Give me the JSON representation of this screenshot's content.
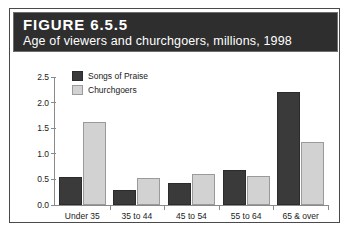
{
  "figure": {
    "title": "FIGURE 6.5.5",
    "subtitle": "Age of viewers and churchgoers, millions, 1998"
  },
  "colors": {
    "series_dark": "#3a3a3a",
    "series_light": "#d2d2d2",
    "header_background": "#2e2e2e",
    "frame_border": "#4a4a4a",
    "axis": "#8a8a8a"
  },
  "chart_data": {
    "type": "bar",
    "title": "Age of viewers and churchgoers, millions, 1998",
    "xlabel": "",
    "ylabel": "",
    "ylim": [
      0.0,
      2.5
    ],
    "yticks": [
      "0.0",
      "0.5",
      "1.0",
      "1.5",
      "2.0",
      "2.5"
    ],
    "ytick_values": [
      0.0,
      0.5,
      1.0,
      1.5,
      2.0,
      2.5
    ],
    "grid": false,
    "legend_position": "top-left inside",
    "categories": [
      "Under 35",
      "35 to 44",
      "45 to 54",
      "55 to 64",
      "65 & over"
    ],
    "series": [
      {
        "name": "Songs of Praise",
        "color": "#3a3a3a",
        "values": [
          0.55,
          0.3,
          0.43,
          0.68,
          2.2
        ]
      },
      {
        "name": "Churchgoers",
        "color": "#d2d2d2",
        "values": [
          1.62,
          0.53,
          0.6,
          0.57,
          1.23
        ]
      }
    ]
  }
}
